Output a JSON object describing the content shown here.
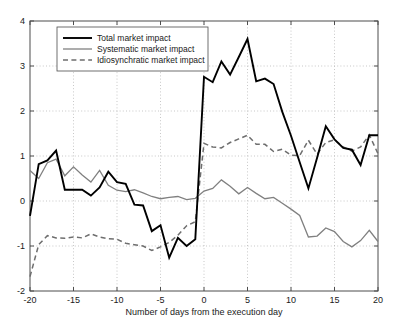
{
  "chart_data": {
    "type": "line",
    "title": "",
    "xlabel": "Number of days from the execution day",
    "ylabel": "",
    "xlim": [
      -20,
      20
    ],
    "ylim": [
      -2,
      4
    ],
    "xticks": [
      -20,
      -15,
      -10,
      -5,
      0,
      5,
      10,
      15,
      20
    ],
    "xtick_labels": [
      "-20",
      "-15",
      "-10",
      "-5",
      "0",
      "5",
      "10",
      "15",
      "20"
    ],
    "yticks": [
      -2,
      -1,
      0,
      1,
      2,
      3,
      4
    ],
    "ytick_labels": [
      "-2",
      "-1",
      "0",
      "1",
      "2",
      "3",
      "4"
    ],
    "grid": true,
    "legend_position": "upper left",
    "x": [
      -20,
      -19,
      -18,
      -17,
      -16,
      -15,
      -14,
      -13,
      -12,
      -11,
      -10,
      -9,
      -8,
      -7,
      -6,
      -5,
      -4,
      -3,
      -2,
      -1,
      0,
      1,
      2,
      3,
      4,
      5,
      6,
      7,
      8,
      9,
      10,
      11,
      12,
      13,
      14,
      15,
      16,
      17,
      18,
      19,
      20
    ],
    "series": [
      {
        "name": "Total market impact",
        "style": "solid",
        "color": "#000000",
        "width": "thick",
        "values": [
          -0.33,
          0.82,
          0.9,
          1.12,
          0.25,
          0.25,
          0.25,
          0.12,
          0.3,
          0.65,
          0.42,
          0.38,
          -0.08,
          -0.1,
          -0.67,
          -0.54,
          -1.26,
          -0.82,
          -1.0,
          -0.85,
          2.76,
          2.64,
          3.1,
          2.81,
          3.2,
          3.6,
          2.66,
          2.72,
          2.6,
          1.98,
          1.45,
          0.86,
          0.28,
          0.96,
          1.66,
          1.37,
          1.18,
          1.14,
          0.8,
          1.46,
          1.46
        ]
      },
      {
        "name": "Systematic market impact",
        "style": "solid",
        "color": "#808080",
        "width": "thin",
        "values": [
          0.68,
          0.5,
          0.85,
          0.93,
          0.56,
          0.76,
          0.58,
          0.42,
          0.68,
          0.35,
          0.24,
          0.21,
          0.25,
          0.18,
          0.1,
          0.05,
          0.08,
          0.1,
          0.03,
          0.06,
          0.22,
          0.28,
          0.47,
          0.33,
          0.16,
          0.3,
          0.17,
          0.05,
          0.08,
          -0.05,
          -0.18,
          -0.32,
          -0.8,
          -0.78,
          -0.6,
          -0.68,
          -0.9,
          -1.02,
          -0.88,
          -0.65,
          -0.9
        ]
      },
      {
        "name": "Idiosynchratic market impact",
        "style": "dashed",
        "color": "#6e6e6e",
        "width": "medium",
        "values": [
          -1.68,
          -0.97,
          -0.77,
          -0.82,
          -0.83,
          -0.8,
          -0.82,
          -0.73,
          -0.8,
          -0.84,
          -0.85,
          -0.94,
          -0.97,
          -1.0,
          -1.1,
          -1.02,
          -0.92,
          -0.76,
          -0.55,
          -0.46,
          1.28,
          1.2,
          1.18,
          1.3,
          1.38,
          1.46,
          1.26,
          1.26,
          1.1,
          1.15,
          1.02,
          1.01,
          1.35,
          1.04,
          1.3,
          1.36,
          1.2,
          1.11,
          1.2,
          1.47,
          1.05
        ]
      }
    ]
  },
  "legend": {
    "items": [
      {
        "label": "Total market impact"
      },
      {
        "label": "Systematic market impact"
      },
      {
        "label": "Idiosynchratic market impact"
      }
    ]
  },
  "axes": {
    "xlabel": "Number of days from the execution day"
  }
}
